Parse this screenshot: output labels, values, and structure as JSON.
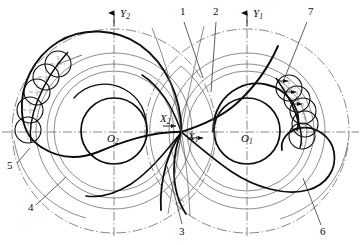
{
  "figure": {
    "kind": "engineering-line-drawing",
    "background_color": "#ffffff",
    "line_color": "#0d0d0d",
    "thin_line_color": "#4a4a4a",
    "width": 361,
    "height": 245
  },
  "axes": {
    "horizontal": {
      "label": "",
      "y": 132
    },
    "y1": {
      "label": "Y",
      "sub": "1",
      "x": 247,
      "top": 12,
      "arrow": true
    },
    "y2": {
      "label": "Y",
      "sub": "2",
      "x": 114,
      "top": 12,
      "arrow": true
    },
    "x1": {
      "label": "X",
      "sub": "1",
      "x": 188,
      "y": 141,
      "arrow": true
    },
    "x2": {
      "label": "X",
      "sub": "2",
      "x": 162,
      "y": 122,
      "arrow": true
    }
  },
  "centers": [
    {
      "name": "O2",
      "label": "O",
      "sub": "2",
      "cx": 114,
      "cy": 131
    },
    {
      "name": "O1",
      "label": "O",
      "sub": "1",
      "cx": 247,
      "cy": 131
    }
  ],
  "pitch_point": {
    "x": 181,
    "y": 132
  },
  "circles_left": {
    "center": [
      114,
      131
    ],
    "outer_dashdot_r": 102,
    "addendum_r": 78,
    "pitch_r": 67,
    "mid_thin_r": 60,
    "root_bold_r": 33
  },
  "circles_right": {
    "center": [
      247,
      131
    ],
    "outer_dashdot_r": 102,
    "addendum_r": 78,
    "pitch_r": 67,
    "mid_thin_r": 60,
    "root_bold_r": 33
  },
  "rolling_circles": {
    "radius": 13,
    "left_chain_count": 5,
    "right_chain_count": 5
  },
  "leaders": [
    {
      "id": "1",
      "label": "1",
      "text_x": 180,
      "text_y": 14,
      "from": [
        184,
        20
      ],
      "to": [
        203,
        76
      ]
    },
    {
      "id": "2",
      "label": "2",
      "text_x": 214,
      "text_y": 14,
      "from": [
        216,
        20
      ],
      "to": [
        212,
        90
      ]
    },
    {
      "id": "3",
      "label": "3",
      "text_x": 179,
      "text_y": 232,
      "from": [
        182,
        224
      ],
      "to": [
        168,
        168
      ]
    },
    {
      "id": "4",
      "label": "4",
      "text_x": 28,
      "text_y": 210,
      "from": [
        36,
        205
      ],
      "to": [
        64,
        178
      ]
    },
    {
      "id": "5",
      "label": "5",
      "text_x": 8,
      "text_y": 170,
      "from": [
        15,
        164
      ],
      "to": [
        28,
        150
      ]
    },
    {
      "id": "6",
      "label": "6",
      "text_x": 322,
      "text_y": 232,
      "from": [
        322,
        225
      ],
      "to": [
        305,
        180
      ]
    },
    {
      "id": "7",
      "label": "7",
      "text_x": 310,
      "text_y": 14,
      "from": [
        308,
        20
      ],
      "to": [
        282,
        80
      ]
    }
  ],
  "legend_note": ""
}
